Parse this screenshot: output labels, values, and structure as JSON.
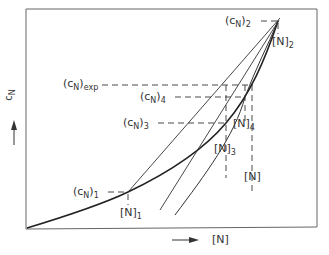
{
  "diagram": {
    "y_axis_label": "c",
    "y_axis_label_sub": "N",
    "x_axis_label": "[N]",
    "labels": {
      "cN2": {
        "base": "(c",
        "sub": "N",
        "close": ")",
        "idx": "2"
      },
      "N2": {
        "base": "[N]",
        "idx": "2"
      },
      "cNexp": {
        "base": "(c",
        "sub": "N",
        "close": ")",
        "idx": "exp"
      },
      "cN4": {
        "base": "(c",
        "sub": "N",
        "close": ")",
        "idx": "4"
      },
      "cN3": {
        "base": "(c",
        "sub": "N",
        "close": ")",
        "idx": "3"
      },
      "N4": {
        "base": "[N]",
        "idx": "4"
      },
      "N3": {
        "base": "[N]",
        "idx": "3"
      },
      "N": {
        "base": "[N]"
      },
      "cN1": {
        "base": "(c",
        "sub": "N",
        "close": ")",
        "idx": "1"
      },
      "N1": {
        "base": "[N]",
        "idx": "1"
      }
    },
    "colors": {
      "line": "#2a2a2a",
      "frame": "#555555",
      "background": "#ffffff"
    }
  }
}
